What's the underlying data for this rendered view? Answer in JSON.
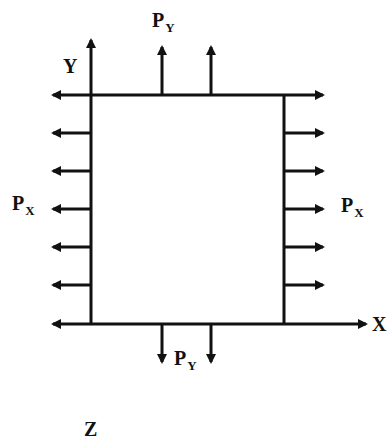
{
  "diagram": {
    "colors": {
      "ink": "#111111",
      "background": "#ffffff"
    },
    "axes": {
      "x_label": "X",
      "y_label": "Y",
      "z_label": "Z"
    },
    "loads": {
      "px_left": {
        "base": "P",
        "sub": "X"
      },
      "px_right": {
        "base": "P",
        "sub": "X"
      },
      "py_top": {
        "base": "P",
        "sub": "Y"
      },
      "py_bottom": {
        "base": "P",
        "sub": "Y"
      }
    },
    "plate": {
      "left": 91,
      "right": 284,
      "top": 95,
      "bottom": 324
    },
    "edge_arrow_rows": [
      95,
      133,
      171,
      209,
      247,
      285,
      324
    ],
    "vertical_arrow_columns": [
      162,
      211
    ]
  }
}
